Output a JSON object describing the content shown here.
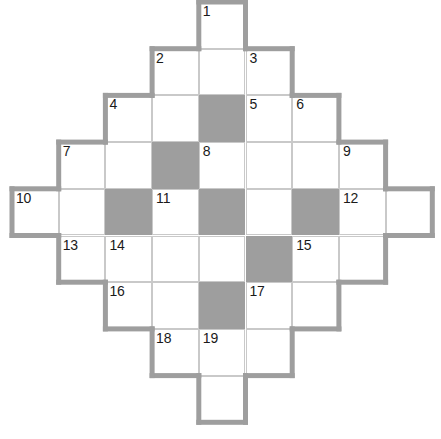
{
  "puzzle": {
    "kind": "crossword-grid",
    "shape": "diamond",
    "columns": 9,
    "rows": 9,
    "cell_size": 46.7,
    "origin_x": 12,
    "origin_y": 2,
    "colors": {
      "cell_fill": "#ffffff",
      "block_fill": "#9e9e9e",
      "inner_grid_line": "#c9c9c9",
      "outer_border": "#9e9e9e",
      "number_text": "#1a1a1a",
      "page_background": "#ffffff"
    },
    "outer_border_width": 5,
    "rows_layout": [
      {
        "row": 0,
        "start_col": 4,
        "end_col": 4
      },
      {
        "row": 1,
        "start_col": 3,
        "end_col": 5
      },
      {
        "row": 2,
        "start_col": 2,
        "end_col": 6
      },
      {
        "row": 3,
        "start_col": 1,
        "end_col": 7
      },
      {
        "row": 4,
        "start_col": 0,
        "end_col": 8
      },
      {
        "row": 5,
        "start_col": 1,
        "end_col": 7
      },
      {
        "row": 6,
        "start_col": 2,
        "end_col": 6
      },
      {
        "row": 7,
        "start_col": 3,
        "end_col": 5
      },
      {
        "row": 8,
        "start_col": 4,
        "end_col": 4
      }
    ],
    "blocks": [
      {
        "row": 2,
        "col": 4
      },
      {
        "row": 3,
        "col": 3
      },
      {
        "row": 4,
        "col": 2
      },
      {
        "row": 4,
        "col": 4
      },
      {
        "row": 4,
        "col": 6
      },
      {
        "row": 5,
        "col": 5
      },
      {
        "row": 6,
        "col": 4
      }
    ],
    "numbers": [
      {
        "n": "1",
        "row": 0,
        "col": 4
      },
      {
        "n": "2",
        "row": 1,
        "col": 3
      },
      {
        "n": "3",
        "row": 1,
        "col": 5
      },
      {
        "n": "4",
        "row": 2,
        "col": 2
      },
      {
        "n": "5",
        "row": 2,
        "col": 5
      },
      {
        "n": "6",
        "row": 2,
        "col": 6
      },
      {
        "n": "7",
        "row": 3,
        "col": 1
      },
      {
        "n": "8",
        "row": 3,
        "col": 4
      },
      {
        "n": "9",
        "row": 3,
        "col": 7
      },
      {
        "n": "10",
        "row": 4,
        "col": 0
      },
      {
        "n": "11",
        "row": 4,
        "col": 3
      },
      {
        "n": "12",
        "row": 4,
        "col": 7
      },
      {
        "n": "13",
        "row": 5,
        "col": 1
      },
      {
        "n": "14",
        "row": 5,
        "col": 2
      },
      {
        "n": "15",
        "row": 5,
        "col": 6
      },
      {
        "n": "16",
        "row": 6,
        "col": 2
      },
      {
        "n": "17",
        "row": 6,
        "col": 5
      },
      {
        "n": "18",
        "row": 7,
        "col": 3
      },
      {
        "n": "19",
        "row": 7,
        "col": 4
      }
    ]
  }
}
